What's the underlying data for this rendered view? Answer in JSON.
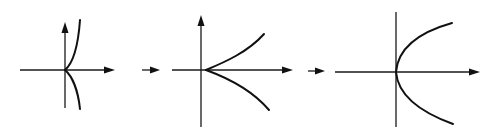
{
  "diagram": {
    "colors": {
      "ink": "#111111",
      "background": "#ffffff"
    },
    "panels": [
      {
        "id": "panel-1",
        "shape": "sharp cusp (vertical tangent branches)",
        "origin": [
          65,
          70
        ]
      },
      {
        "id": "panel-2",
        "shape": "semicubical cusp opening right",
        "origin": [
          201,
          70
        ]
      },
      {
        "id": "panel-3",
        "shape": "parabola opening right",
        "origin": [
          396,
          72
        ]
      }
    ],
    "transitions": [
      {
        "from": "panel-1",
        "to": "panel-2",
        "icon": "right-arrow-icon"
      },
      {
        "from": "panel-2",
        "to": "panel-3",
        "icon": "right-arrow-icon"
      }
    ]
  }
}
